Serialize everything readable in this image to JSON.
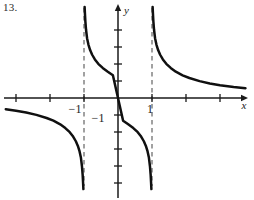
{
  "figure": {
    "problem_number": "13.",
    "background_color": "#ffffff",
    "curve_color": "#101010",
    "axis_color": "#1a1a1a",
    "asymptote_color": "#555555"
  },
  "axes": {
    "x_axis_label": "x",
    "y_axis_label": "y",
    "origin_px": {
      "x": 118,
      "y": 98
    },
    "unit_px": 34,
    "x_axis_y_px": 98,
    "y_axis_x_px": 118,
    "x_axis_start_px": 4,
    "x_axis_end_px": 248,
    "y_axis_start_px": 4,
    "y_axis_end_px": 198,
    "x_tick_positions_px": [
      16,
      50,
      84,
      152,
      186,
      220
    ],
    "y_tick_positions_px": [
      30,
      47,
      64,
      81,
      115,
      132,
      149,
      166,
      183
    ],
    "tick_half_length_px": 4
  },
  "labels": [
    {
      "text": "−1",
      "name": "x-tick-label-negative-one",
      "x_px": 75,
      "y_px": 113
    },
    {
      "text": "1",
      "name": "x-tick-label-one",
      "x_px": 150,
      "y_px": 113
    },
    {
      "text": "−1",
      "name": "y-tick-label-negative-one",
      "x_px": 98,
      "y_px": 122
    }
  ],
  "asymptotes": [
    {
      "name": "asymptote-x-equals-negative-one",
      "equation": "x = -1",
      "x_px": 84,
      "y_top_px": 8,
      "y_bottom_px": 186
    },
    {
      "name": "asymptote-x-equals-one",
      "equation": "x = 1",
      "x_px": 152,
      "y_top_px": 8,
      "y_bottom_px": 186
    }
  ],
  "chart_data": {
    "type": "line",
    "title": "",
    "subtitle": "",
    "xlabel": "x",
    "ylabel": "y",
    "function": "y = x / (x^2 - 1)",
    "grid": false,
    "legend": null,
    "xlim": [
      -3.35,
      3.82
    ],
    "ylim": [
      -2.76,
      2.76
    ],
    "xticks": [
      -3,
      -2,
      -1,
      1,
      2,
      3
    ],
    "yticks": [
      -2,
      -1.5,
      -1,
      -0.5,
      0.5,
      1,
      1.5,
      2,
      2.5
    ],
    "xtick_labels": [
      "",
      "",
      "−1",
      "1",
      "",
      ""
    ],
    "ytick_labels": [
      "",
      "",
      "−1",
      "",
      "",
      "",
      "",
      "",
      ""
    ],
    "vertical_asymptotes": [
      -1,
      1
    ],
    "horizontal_asymptote": 0,
    "annotations": [
      "13."
    ],
    "series": [
      {
        "name": "branch-left",
        "comment": "x < -1, approaches 0 from below as x -> -inf, dives to -inf at x = -1",
        "points": [
          [
            -3.3,
            -0.33
          ],
          [
            -3.0,
            -0.375
          ],
          [
            -2.7,
            -0.428
          ],
          [
            -2.4,
            -0.496
          ],
          [
            -2.1,
            -0.588
          ],
          [
            -1.9,
            -0.668
          ],
          [
            -1.7,
            -0.773
          ],
          [
            -1.55,
            -0.884
          ],
          [
            -1.42,
            -1.005
          ],
          [
            -1.32,
            -1.133
          ],
          [
            -1.24,
            -1.272
          ],
          [
            -1.18,
            -1.411
          ],
          [
            -1.13,
            -1.572
          ],
          [
            -1.09,
            -1.759
          ],
          [
            -1.06,
            -2.008
          ],
          [
            -1.04,
            -2.256
          ],
          [
            -1.027,
            -2.494
          ],
          [
            -1.018,
            -2.68
          ]
        ]
      },
      {
        "name": "branch-middle",
        "comment": "-1 < x < 1, from +inf at x = -1 down through origin to -inf at x = 1",
        "points": [
          [
            -0.982,
            2.68
          ],
          [
            -0.973,
            2.494
          ],
          [
            -0.96,
            2.256
          ],
          [
            -0.94,
            2.008
          ],
          [
            -0.91,
            1.759
          ],
          [
            -0.87,
            1.572
          ],
          [
            -0.82,
            1.411
          ],
          [
            -0.76,
            1.272
          ],
          [
            -0.68,
            1.133
          ],
          [
            -0.58,
            1.005
          ],
          [
            -0.45,
            0.884
          ],
          [
            -0.3,
            0.773
          ],
          [
            -0.15,
            0.668
          ],
          [
            0.0,
            0.0
          ],
          [
            0.15,
            -0.668
          ],
          [
            0.3,
            -0.773
          ],
          [
            0.45,
            -0.884
          ],
          [
            0.58,
            -1.005
          ],
          [
            0.68,
            -1.133
          ],
          [
            0.76,
            -1.272
          ],
          [
            0.82,
            -1.411
          ],
          [
            0.87,
            -1.572
          ],
          [
            0.91,
            -1.759
          ],
          [
            0.94,
            -2.008
          ],
          [
            0.96,
            -2.256
          ],
          [
            0.973,
            -2.494
          ],
          [
            0.982,
            -2.68
          ]
        ]
      },
      {
        "name": "branch-right",
        "comment": "x > 1, from +inf at x = 1 decaying toward 0 from above",
        "points": [
          [
            1.018,
            2.68
          ],
          [
            1.027,
            2.494
          ],
          [
            1.04,
            2.256
          ],
          [
            1.06,
            2.008
          ],
          [
            1.09,
            1.759
          ],
          [
            1.13,
            1.572
          ],
          [
            1.18,
            1.411
          ],
          [
            1.24,
            1.272
          ],
          [
            1.32,
            1.133
          ],
          [
            1.42,
            1.005
          ],
          [
            1.55,
            0.884
          ],
          [
            1.7,
            0.773
          ],
          [
            1.9,
            0.668
          ],
          [
            2.1,
            0.588
          ],
          [
            2.4,
            0.496
          ],
          [
            2.7,
            0.428
          ],
          [
            3.0,
            0.375
          ],
          [
            3.4,
            0.322
          ],
          [
            3.75,
            0.287
          ]
        ]
      }
    ]
  }
}
